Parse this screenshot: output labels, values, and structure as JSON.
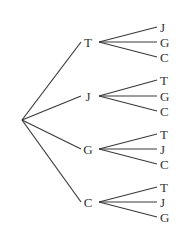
{
  "diagram": {
    "type": "tree-diagram",
    "colors": {
      "line": "#3a3a3a",
      "text": "#333333",
      "background": "#ffffff"
    },
    "root": {
      "x": 22,
      "y": 120
    },
    "level1_label_x": 84,
    "branch_start_x": 99,
    "leaf_end_x": 157,
    "leaf_label_x": 160,
    "nodes": [
      {
        "label": "T",
        "y": 42,
        "children": [
          {
            "label": "J",
            "y": 27
          },
          {
            "label": "G",
            "y": 42
          },
          {
            "label": "C",
            "y": 57
          }
        ]
      },
      {
        "label": "J",
        "y": 96,
        "children": [
          {
            "label": "T",
            "y": 80
          },
          {
            "label": "G",
            "y": 96
          },
          {
            "label": "C",
            "y": 111
          }
        ]
      },
      {
        "label": "G",
        "y": 149,
        "children": [
          {
            "label": "T",
            "y": 134
          },
          {
            "label": "J",
            "y": 149
          },
          {
            "label": "C",
            "y": 164
          }
        ]
      },
      {
        "label": "C",
        "y": 202,
        "children": [
          {
            "label": "T",
            "y": 187
          },
          {
            "label": "J",
            "y": 202
          },
          {
            "label": "G",
            "y": 217
          }
        ]
      }
    ]
  }
}
